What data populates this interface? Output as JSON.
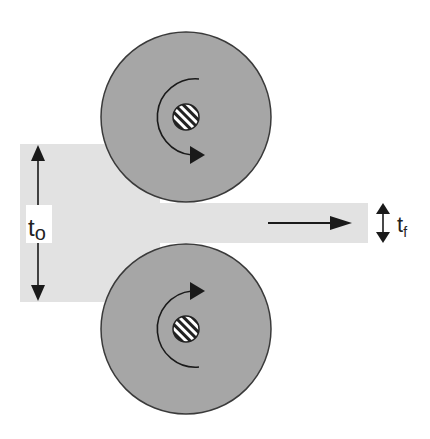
{
  "diagram": {
    "labels": {
      "initial_thickness": "t",
      "initial_thickness_sub": "o",
      "final_thickness": "t",
      "final_thickness_sub": "f"
    },
    "colors": {
      "roller": "#a6a6a6",
      "roller_outline": "#3a3a3a",
      "strip": "#e2e2e2",
      "arrow": "#1a1a1a",
      "background": "#ffffff"
    },
    "components": [
      "top roller",
      "bottom roller",
      "workpiece strip",
      "feed direction arrow",
      "thickness dimension arrows"
    ]
  }
}
